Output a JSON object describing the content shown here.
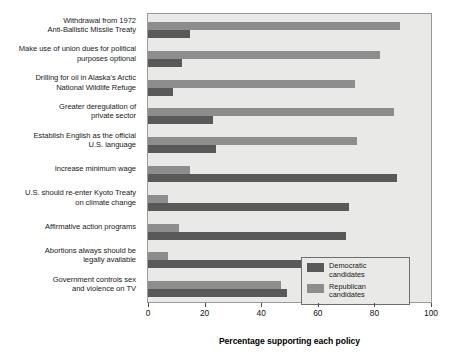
{
  "chart_data": {
    "type": "bar",
    "orientation": "horizontal",
    "title": "",
    "xlabel": "Percentage supporting each policy",
    "ylabel": "",
    "xlim": [
      0,
      100
    ],
    "xticks": [
      0,
      20,
      40,
      60,
      80,
      100
    ],
    "grid": false,
    "legend_position": "bottom-right",
    "categories": [
      "Withdrawal from 1972\nAnti-Ballistic Missile Treaty",
      "Make use of union dues for political\npurposes optional",
      "Drilling for oil in Alaska's Arctic\nNational Wildlife Refuge",
      "Greater deregulation of\nprivate sector",
      "Establish English as the official\nU.S. language",
      "Increase minimum wage",
      "U.S. should re-enter Kyoto Treaty\non climate change",
      "Affirmative action programs",
      "Abortions always should be\nlegally available",
      "Government controls sex\nand violence on TV"
    ],
    "series": [
      {
        "name": "Republican candidates",
        "color": "#8d8d8d",
        "values": [
          89,
          82,
          73,
          87,
          74,
          15,
          7,
          11,
          7,
          47
        ]
      },
      {
        "name": "Democratic candidates",
        "color": "#595959",
        "values": [
          15,
          12,
          9,
          23,
          24,
          88,
          71,
          70,
          59,
          49
        ]
      }
    ]
  },
  "categories_display": [
    {
      "line1": "Withdrawal from 1972",
      "line2": "Anti-Ballistic Missile Treaty"
    },
    {
      "line1": "Make use of union dues for political",
      "line2": "purposes optional"
    },
    {
      "line1": "Drilling for oil in Alaska's Arctic",
      "line2": "National Wildlife Refuge"
    },
    {
      "line1": "Greater deregulation of",
      "line2": "private sector"
    },
    {
      "line1": "Establish English as the official",
      "line2": "U.S. language"
    },
    {
      "line1": "Increase minimum wage",
      "line2": ""
    },
    {
      "line1": "U.S. should re-enter Kyoto Treaty",
      "line2": "on climate change"
    },
    {
      "line1": "Affirmative action programs",
      "line2": ""
    },
    {
      "line1": "Abortions always should be",
      "line2": "legally available"
    },
    {
      "line1": "Government controls sex",
      "line2": "and violence on TV"
    }
  ],
  "legend": {
    "entries": [
      {
        "label_line1": "Democratic",
        "label_line2": "candidates",
        "color": "#595959"
      },
      {
        "label_line1": "Republican",
        "label_line2": "candidates",
        "color": "#8d8d8d"
      }
    ]
  },
  "axis": {
    "title": "Percentage supporting each policy",
    "ticks": [
      "0",
      "20",
      "40",
      "60",
      "80",
      "100"
    ]
  },
  "colors": {
    "plot_background": "#e9e9e7",
    "democratic": "#595959",
    "republican": "#8d8d8d",
    "border": "#9a9a9a"
  }
}
